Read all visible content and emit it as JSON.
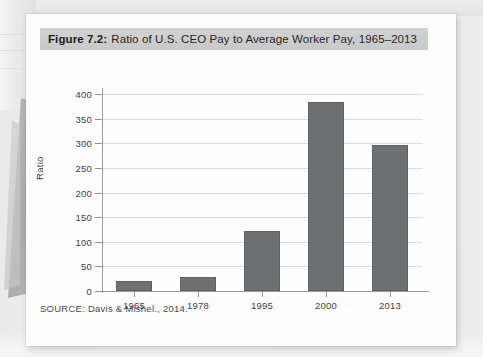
{
  "figure": {
    "caption_number": "Figure 7.2:",
    "caption_text": "Ratio of U.S. CEO Pay to Average Worker Pay, 1965–2013",
    "source": "SOURCE: Davis & Mishel., 2014."
  },
  "colors": {
    "bar_fill": "#6e7174",
    "bar_stroke": "#5f6265",
    "caption_band": "#cdcdcd",
    "gridline": "#dcdcdc",
    "axis": "#9a9a9a",
    "page": "#fdfdfd",
    "backdrop": "#efefef"
  },
  "chart_data": {
    "type": "bar",
    "title": "Ratio of U.S. CEO Pay to Average Worker Pay, 1965–2013",
    "xlabel": "",
    "ylabel": "Ratio",
    "categories": [
      "1965",
      "1978",
      "1995",
      "2000",
      "2013"
    ],
    "values": [
      20,
      29,
      122,
      383,
      296
    ],
    "ylim": [
      0,
      400
    ],
    "yticks": [
      0,
      50,
      100,
      150,
      200,
      250,
      300,
      350,
      400
    ],
    "ytick_labels": [
      "0",
      "50",
      "100",
      "150",
      "200",
      "250",
      "300",
      "350",
      "400"
    ],
    "grid": true,
    "legend": "none",
    "source": "SOURCE: Davis & Mishel., 2014."
  }
}
